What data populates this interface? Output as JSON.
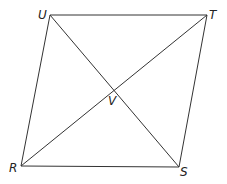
{
  "diagram": {
    "type": "parallelogram-with-diagonals",
    "vertices": {
      "U": {
        "label": "U",
        "x": 50,
        "y": 15
      },
      "T": {
        "label": "T",
        "x": 207,
        "y": 15
      },
      "S": {
        "label": "S",
        "x": 179,
        "y": 167
      },
      "R": {
        "label": "R",
        "x": 21,
        "y": 166
      }
    },
    "intersection": {
      "label": "V",
      "x": 114,
      "y": 91
    },
    "sides": [
      "UT",
      "TS",
      "SR",
      "RU"
    ],
    "diagonals": [
      "US",
      "RT"
    ],
    "stroke_color": "#333333"
  }
}
